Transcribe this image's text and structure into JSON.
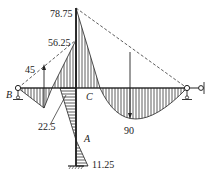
{
  "diagram": {
    "type": "bending-moment-diagram",
    "values": {
      "top_of_column": "78.75",
      "joint_left": "56.25",
      "left_span_mid": "45",
      "left_span_neg": "22.5",
      "right_span_max": "90",
      "column_base": "11.25"
    },
    "points": {
      "B": "B",
      "C": "C",
      "A": "A"
    },
    "colors": {
      "line": "#222222",
      "hatch": "#333333",
      "background": "#ffffff"
    }
  }
}
